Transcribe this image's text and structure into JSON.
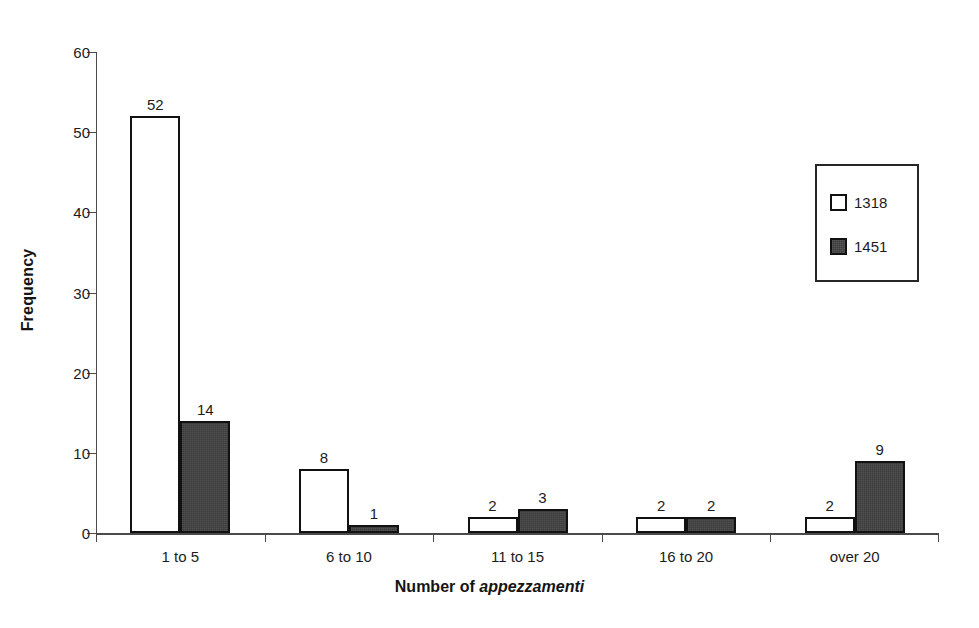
{
  "chart_data": {
    "type": "bar",
    "title": "",
    "xlabel": "Number of appezzamenti",
    "xlabel_plain": "Number of",
    "xlabel_italic": "appezzamenti",
    "ylabel": "Frequency",
    "categories": [
      "1 to 5",
      "6 to 10",
      "11 to 15",
      "16 to 20",
      "over 20"
    ],
    "series": [
      {
        "name": "1318",
        "values": [
          52,
          8,
          2,
          2,
          2
        ],
        "fill": "#ffffff"
      },
      {
        "name": "1451",
        "values": [
          14,
          1,
          3,
          2,
          9
        ],
        "fill": "#3b3b3b"
      }
    ],
    "ylim": [
      0,
      60
    ],
    "yticks": [
      0,
      10,
      20,
      30,
      40,
      50,
      60
    ],
    "ytick_labels": [
      "0",
      "10",
      "20",
      "30",
      "40",
      "50",
      "60"
    ],
    "grid": false,
    "legend_position": "upper right",
    "value_labels": true
  },
  "legend": {
    "entries": [
      {
        "label": "1318",
        "swatch": "open-square-swatch"
      },
      {
        "label": "1451",
        "swatch": "filled-square-swatch"
      }
    ]
  },
  "colors": {
    "series_a_fill": "#ffffff",
    "series_b_fill": "#3b3b3b",
    "bar_outline": "#111111",
    "axis": "#4a4a4a",
    "text": "#1c1c1c",
    "background": "#ffffff"
  }
}
